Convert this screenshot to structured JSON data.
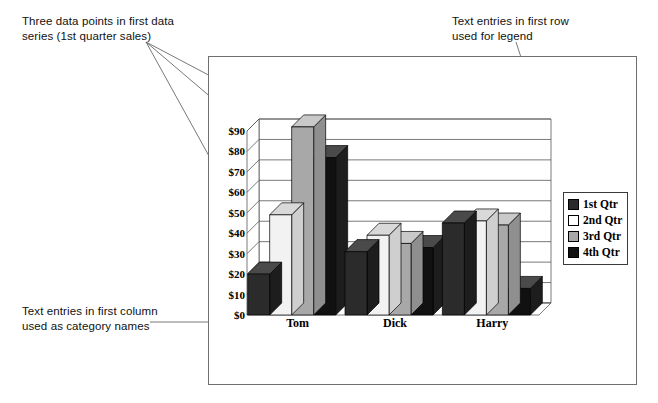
{
  "annotations": {
    "top_left": "Three data points in first data\nseries (1st quarter sales)",
    "top_right": "Text entries in first row\nused for legend",
    "bottom_left": "Text entries in first column\nused as category names"
  },
  "legend": {
    "position": "right",
    "items": [
      {
        "label": "1st Qtr",
        "color": "#2b2b2b"
      },
      {
        "label": "2nd Qtr",
        "color": "#ffffff"
      },
      {
        "label": "3rd Qtr",
        "color": "#a8a8a8"
      },
      {
        "label": "4th Qtr",
        "color": "#111111"
      }
    ]
  },
  "chart_data": {
    "type": "bar",
    "title": "",
    "xlabel": "",
    "ylabel": "",
    "categories": [
      "Tom",
      "Dick",
      "Harry"
    ],
    "ytick_labels": [
      "$0",
      "$10",
      "$20",
      "$30",
      "$40",
      "$50",
      "$60",
      "$70",
      "$80",
      "$90"
    ],
    "ylim": [
      0,
      90
    ],
    "ytick_step": 10,
    "grid": true,
    "three_d": true,
    "legend_position": "right",
    "series": [
      {
        "name": "1st Qtr",
        "color": "#2b2b2b",
        "values": [
          20,
          31,
          45
        ]
      },
      {
        "name": "2nd Qtr",
        "color": "#f2f2f2",
        "values": [
          49,
          39,
          46
        ]
      },
      {
        "name": "3rd Qtr",
        "color": "#a8a8a8",
        "values": [
          92,
          35,
          44
        ]
      },
      {
        "name": "4th Qtr",
        "color": "#111111",
        "values": [
          77,
          33,
          13
        ]
      }
    ]
  }
}
